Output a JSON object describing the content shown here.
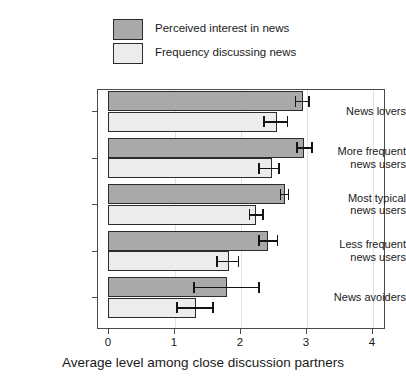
{
  "chart_data": {
    "type": "bar",
    "orientation": "horizontal",
    "title": "",
    "xlabel": "Average level among close discussion partners",
    "ylabel": "",
    "xlim": [
      0,
      4.2
    ],
    "xticks": [
      "0",
      "1",
      "2",
      "3",
      "4"
    ],
    "xtick_values": [
      0,
      1,
      2,
      3,
      4
    ],
    "grid": true,
    "legend_position": "top",
    "categories": [
      "News lovers",
      "More frequent news users",
      "Most typical news users",
      "Less frequent news users",
      "News avoiders"
    ],
    "category_lines": [
      [
        "News lovers"
      ],
      [
        "More frequent",
        "news users"
      ],
      [
        "Most typical",
        "news users"
      ],
      [
        "Less frequent",
        "news users"
      ],
      [
        "News avoiders"
      ]
    ],
    "series": [
      {
        "name": "Perceived interest in news",
        "color": "#a9a9a9",
        "values": [
          2.95,
          2.97,
          2.68,
          2.43,
          1.81
        ],
        "ci_low": [
          2.83,
          2.85,
          2.6,
          2.28,
          1.29
        ],
        "ci_high": [
          3.06,
          3.1,
          2.75,
          2.58,
          2.3
        ]
      },
      {
        "name": "Frequency discussing news",
        "color": "#ececec",
        "values": [
          2.56,
          2.48,
          2.24,
          1.84,
          1.34
        ],
        "ci_low": [
          2.35,
          2.28,
          2.13,
          1.64,
          1.03
        ],
        "ci_high": [
          2.73,
          2.6,
          2.36,
          1.99,
          1.6
        ]
      }
    ]
  },
  "legend": {
    "items": [
      {
        "label": "Perceived interest in news",
        "color": "#a9a9a9"
      },
      {
        "label": "Frequency discussing news",
        "color": "#ececec"
      }
    ]
  }
}
